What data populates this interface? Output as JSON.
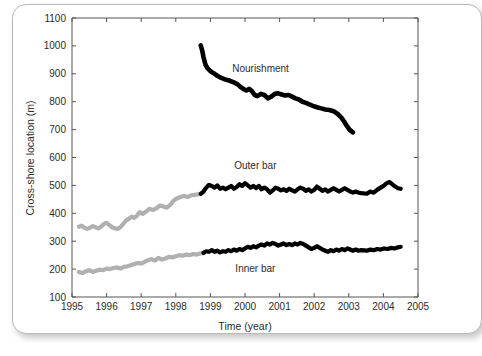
{
  "chart_data": {
    "type": "line",
    "title": "",
    "xlabel": "Time (year)",
    "ylabel": "Cross-shore location (m)",
    "xlim": [
      1995,
      2005
    ],
    "ylim": [
      100,
      1100
    ],
    "xticks": [
      1995,
      1996,
      1997,
      1998,
      1999,
      2000,
      2001,
      2002,
      2003,
      2004,
      2005
    ],
    "yticks": [
      100,
      200,
      300,
      400,
      500,
      600,
      700,
      800,
      900,
      1000,
      1100
    ],
    "grid": false,
    "legend_position": "inline-annotations",
    "colors": {
      "black": "#000000",
      "gray": "#b0b0b0",
      "axis": "#555555",
      "text": "#2b2b2b"
    },
    "annotations": [
      {
        "label": "Nourishment",
        "x": 2000.45,
        "y": 905
      },
      {
        "label": "Outer bar",
        "x": 2000.3,
        "y": 558
      },
      {
        "label": "Inner bar",
        "x": 2000.3,
        "y": 188
      }
    ],
    "series": [
      {
        "name": "Nourishment",
        "color": "#000000",
        "style": "thick-dotted-line",
        "x": [
          1998.72,
          1998.76,
          1998.8,
          1998.86,
          1998.92,
          1998.98,
          1999.04,
          1999.12,
          1999.2,
          1999.3,
          1999.42,
          1999.54,
          1999.66,
          1999.78,
          1999.88,
          1999.96,
          2000.04,
          2000.12,
          2000.2,
          2000.28,
          2000.36,
          2000.46,
          2000.56,
          2000.66,
          2000.76,
          2000.86,
          2000.96,
          2001.06,
          2001.16,
          2001.26,
          2001.36,
          2001.46,
          2001.56,
          2001.66,
          2001.76,
          2001.86,
          2001.96,
          2002.08,
          2002.2,
          2002.32,
          2002.44,
          2002.56,
          2002.68,
          2002.78,
          2002.86,
          2002.94,
          2003.02,
          2003.12
        ],
        "y": [
          1002,
          985,
          960,
          932,
          920,
          912,
          906,
          900,
          893,
          886,
          880,
          876,
          870,
          863,
          852,
          845,
          840,
          846,
          838,
          824,
          820,
          828,
          824,
          812,
          818,
          828,
          830,
          826,
          822,
          824,
          818,
          812,
          808,
          800,
          796,
          790,
          785,
          780,
          776,
          772,
          770,
          766,
          756,
          744,
          730,
          714,
          700,
          690
        ]
      },
      {
        "name": "Outer bar (pre-nourishment, gray)",
        "color": "#b0b0b0",
        "style": "thick-line",
        "x": [
          1995.2,
          1995.28,
          1995.36,
          1995.44,
          1995.52,
          1995.6,
          1995.68,
          1995.76,
          1995.84,
          1995.92,
          1996.0,
          1996.08,
          1996.16,
          1996.24,
          1996.32,
          1996.4,
          1996.48,
          1996.56,
          1996.64,
          1996.72,
          1996.8,
          1996.88,
          1996.96,
          1997.04,
          1997.14,
          1997.24,
          1997.34,
          1997.44,
          1997.54,
          1997.64,
          1997.74,
          1997.84,
          1997.94,
          1998.04,
          1998.14,
          1998.24,
          1998.34,
          1998.44,
          1998.54,
          1998.64,
          1998.72
        ],
        "y": [
          352,
          356,
          348,
          344,
          348,
          354,
          350,
          346,
          352,
          362,
          366,
          358,
          350,
          346,
          344,
          350,
          362,
          374,
          380,
          388,
          384,
          392,
          404,
          398,
          406,
          416,
          412,
          418,
          428,
          424,
          420,
          430,
          446,
          454,
          458,
          462,
          458,
          464,
          466,
          468,
          470
        ]
      },
      {
        "name": "Outer bar (post-nourishment, black)",
        "color": "#000000",
        "style": "thick-line",
        "x": [
          1998.72,
          1998.8,
          1998.88,
          1998.96,
          1999.04,
          1999.12,
          1999.2,
          1999.28,
          1999.36,
          1999.44,
          1999.52,
          1999.6,
          1999.68,
          1999.76,
          1999.84,
          1999.92,
          2000.0,
          2000.08,
          2000.16,
          2000.24,
          2000.32,
          2000.4,
          2000.48,
          2000.56,
          2000.64,
          2000.72,
          2000.8,
          2000.88,
          2000.96,
          2001.04,
          2001.12,
          2001.2,
          2001.28,
          2001.36,
          2001.44,
          2001.52,
          2001.6,
          2001.68,
          2001.76,
          2001.84,
          2001.92,
          2002.0,
          2002.08,
          2002.16,
          2002.24,
          2002.32,
          2002.4,
          2002.48,
          2002.56,
          2002.64,
          2002.72,
          2002.8,
          2002.88,
          2002.96,
          2003.04,
          2003.12,
          2003.2,
          2003.28,
          2003.36,
          2003.52,
          2003.62,
          2003.72,
          2003.82,
          2003.92,
          2004.02,
          2004.1,
          2004.18,
          2004.26,
          2004.34,
          2004.42,
          2004.5
        ],
        "y": [
          470,
          478,
          492,
          502,
          498,
          492,
          500,
          488,
          492,
          486,
          492,
          498,
          488,
          494,
          504,
          498,
          508,
          500,
          492,
          498,
          490,
          498,
          486,
          492,
          486,
          474,
          482,
          492,
          488,
          482,
          486,
          480,
          488,
          482,
          478,
          486,
          492,
          488,
          480,
          486,
          478,
          484,
          496,
          488,
          480,
          486,
          478,
          484,
          490,
          484,
          478,
          484,
          490,
          484,
          478,
          474,
          478,
          474,
          472,
          470,
          478,
          474,
          484,
          492,
          500,
          508,
          512,
          504,
          496,
          490,
          488
        ]
      },
      {
        "name": "Inner bar (pre-nourishment, gray)",
        "color": "#b0b0b0",
        "style": "thick-line",
        "x": [
          1995.2,
          1995.3,
          1995.4,
          1995.5,
          1995.6,
          1995.7,
          1995.8,
          1995.9,
          1996.0,
          1996.1,
          1996.2,
          1996.3,
          1996.4,
          1996.5,
          1996.6,
          1996.7,
          1996.8,
          1996.9,
          1997.0,
          1997.1,
          1997.2,
          1997.3,
          1997.4,
          1997.5,
          1997.6,
          1997.7,
          1997.8,
          1997.9,
          1998.0,
          1998.1,
          1998.2,
          1998.3,
          1998.4,
          1998.5,
          1998.6,
          1998.7,
          1998.8
        ],
        "y": [
          190,
          186,
          192,
          196,
          190,
          194,
          198,
          196,
          202,
          200,
          204,
          206,
          202,
          208,
          210,
          214,
          218,
          222,
          220,
          226,
          232,
          236,
          230,
          240,
          234,
          238,
          244,
          242,
          246,
          250,
          248,
          252,
          250,
          254,
          252,
          256,
          258
        ]
      },
      {
        "name": "Inner bar (post-nourishment, black)",
        "color": "#000000",
        "style": "thick-line",
        "x": [
          1998.8,
          1998.88,
          1998.96,
          1999.04,
          1999.12,
          1999.2,
          1999.28,
          1999.36,
          1999.44,
          1999.52,
          1999.6,
          1999.68,
          1999.76,
          1999.84,
          1999.92,
          2000.0,
          2000.08,
          2000.16,
          2000.24,
          2000.32,
          2000.4,
          2000.48,
          2000.56,
          2000.64,
          2000.72,
          2000.8,
          2000.88,
          2000.96,
          2001.04,
          2001.12,
          2001.2,
          2001.28,
          2001.36,
          2001.44,
          2001.52,
          2001.6,
          2001.68,
          2001.76,
          2001.84,
          2001.92,
          2002.0,
          2002.08,
          2002.16,
          2002.24,
          2002.32,
          2002.4,
          2002.48,
          2002.56,
          2002.64,
          2002.72,
          2002.8,
          2002.88,
          2002.96,
          2003.04,
          2003.12,
          2003.2,
          2003.28,
          2003.36,
          2003.52,
          2003.62,
          2003.72,
          2003.82,
          2003.92,
          2004.02,
          2004.12,
          2004.22,
          2004.32,
          2004.42,
          2004.5
        ],
        "y": [
          258,
          264,
          262,
          268,
          262,
          266,
          260,
          264,
          262,
          268,
          264,
          270,
          266,
          272,
          268,
          274,
          280,
          276,
          282,
          278,
          284,
          288,
          284,
          292,
          288,
          294,
          290,
          284,
          288,
          292,
          286,
          290,
          286,
          292,
          288,
          294,
          290,
          284,
          278,
          272,
          276,
          282,
          276,
          270,
          266,
          262,
          268,
          264,
          270,
          266,
          272,
          268,
          274,
          270,
          266,
          270,
          266,
          268,
          266,
          270,
          268,
          272,
          270,
          274,
          272,
          276,
          274,
          278,
          280
        ]
      }
    ]
  }
}
